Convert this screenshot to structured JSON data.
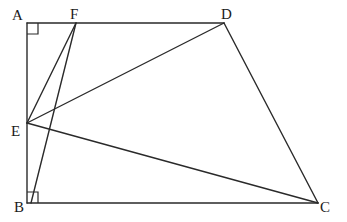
{
  "diagram": {
    "type": "geometry",
    "points": {
      "A": {
        "label": "A",
        "x": 27,
        "y": 23
      },
      "F": {
        "label": "F",
        "x": 76,
        "y": 23
      },
      "D": {
        "label": "D",
        "x": 224,
        "y": 23
      },
      "E": {
        "label": "E",
        "x": 27,
        "y": 123
      },
      "B": {
        "label": "B",
        "x": 27,
        "y": 203
      },
      "C": {
        "label": "C",
        "x": 318,
        "y": 203
      }
    },
    "segments": [
      [
        "A",
        "D"
      ],
      [
        "D",
        "C"
      ],
      [
        "C",
        "B"
      ],
      [
        "B",
        "A"
      ],
      [
        "E",
        "F"
      ],
      [
        "F",
        "B"
      ],
      [
        "E",
        "D"
      ],
      [
        "E",
        "C"
      ]
    ],
    "right_angles": [
      "A",
      "B"
    ]
  }
}
